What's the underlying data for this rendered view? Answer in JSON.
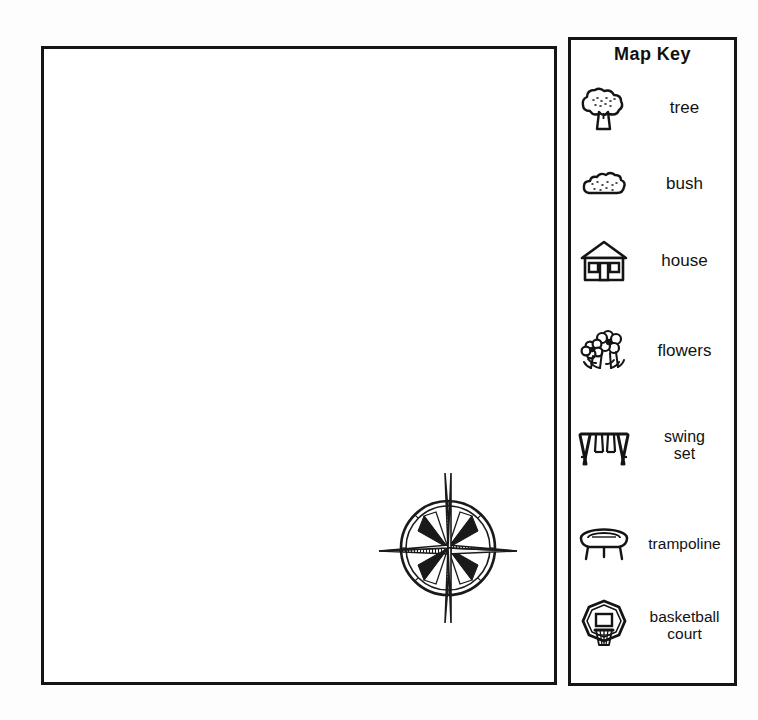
{
  "page": {
    "background_color": "#fdfdfd",
    "ink_color": "#151515",
    "title": "Map Key"
  },
  "map_area": {
    "name": "map-drawing-area",
    "contents": "blank",
    "compass": {
      "icon": "compass-rose-icon",
      "points": 4,
      "has_circle": true
    }
  },
  "map_key": {
    "title": "Map Key",
    "items": [
      {
        "icon": "tree-icon",
        "label": "tree"
      },
      {
        "icon": "bush-icon",
        "label": "bush"
      },
      {
        "icon": "house-icon",
        "label": "house"
      },
      {
        "icon": "flowers-icon",
        "label": "flowers"
      },
      {
        "icon": "swing-set-icon",
        "label": "swing\nset"
      },
      {
        "icon": "trampoline-icon",
        "label": "trampoline"
      },
      {
        "icon": "basketball-court-icon",
        "label": "basketball\ncourt"
      }
    ]
  }
}
